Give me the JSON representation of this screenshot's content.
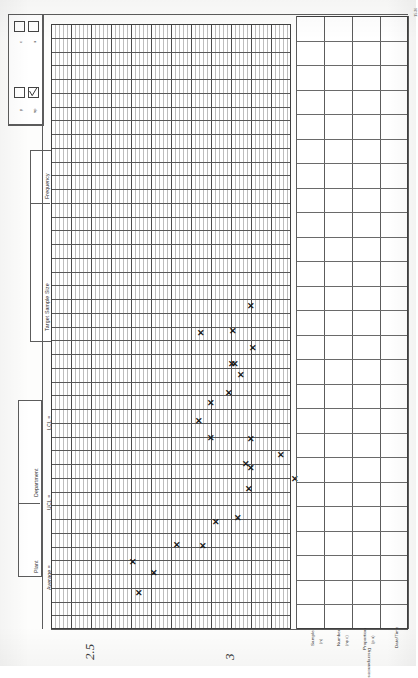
{
  "document": {
    "title": "Attributes Control Chart (p / np / c / u)",
    "form_code": "15-36",
    "orientation": "rotated-90"
  },
  "chart_type_checkboxes": [
    {
      "label": "c",
      "checked": false,
      "name": "checkbox-c"
    },
    {
      "label": "u",
      "checked": false,
      "name": "checkbox-u"
    },
    {
      "label": "p",
      "checked": false,
      "name": "checkbox-p"
    },
    {
      "label": "np",
      "checked": true,
      "name": "checkbox-np"
    }
  ],
  "header_fields": [
    {
      "label": "Frequency",
      "value": ""
    },
    {
      "label": "Target Sample Size",
      "value": ""
    },
    {
      "label": "Plant",
      "value": ""
    },
    {
      "label": "Department",
      "value": ""
    }
  ],
  "limit_fields": [
    {
      "label": "LCL =",
      "value": ""
    },
    {
      "label": "UCL =",
      "value": ""
    },
    {
      "label": "Average =",
      "value": ""
    }
  ],
  "table": {
    "row_group_label": "Discrepancies",
    "row_headers": [
      {
        "label": "Sample",
        "sub": "(n)"
      },
      {
        "label": "Number",
        "sub": "(np c)"
      },
      {
        "label": "Proportion",
        "sub": "(p u)"
      },
      {
        "label": "Date/Time",
        "sub": ""
      }
    ],
    "column_count": 25,
    "values": []
  },
  "axis_annotations": [
    {
      "text": "2.5",
      "handwritten": true
    },
    {
      "text": "3",
      "handwritten": true
    }
  ],
  "chart_data": {
    "type": "scatter",
    "xlabel": "Sample",
    "ylabel": "Number / Proportion",
    "marker": "x",
    "grid": true,
    "legend": "none",
    "xlim": [
      0,
      25
    ],
    "ylim": [
      0,
      60
    ],
    "x": [
      1,
      2,
      3,
      4,
      5,
      6,
      7,
      8,
      9,
      10,
      11,
      12,
      13,
      14,
      15,
      16,
      17,
      18,
      19,
      20,
      21,
      22,
      23,
      24
    ],
    "values": [
      3.0,
      2.0,
      3.5,
      4.0,
      5.5,
      5.0,
      7.0,
      9.5,
      11.5,
      12.0,
      13.0,
      16.5,
      17.0,
      18.5,
      20.0,
      22.5,
      24.5,
      27.0,
      30.0,
      32.0,
      34.5,
      37.0,
      40.5,
      43.0
    ],
    "points": [
      {
        "px": 138,
        "py": 593
      },
      {
        "px": 132,
        "py": 562
      },
      {
        "px": 153,
        "py": 573
      },
      {
        "px": 176,
        "py": 545
      },
      {
        "px": 202,
        "py": 546
      },
      {
        "px": 215,
        "py": 522
      },
      {
        "px": 237,
        "py": 518
      },
      {
        "px": 248,
        "py": 489
      },
      {
        "px": 294,
        "py": 479
      },
      {
        "px": 250,
        "py": 468
      },
      {
        "px": 250,
        "py": 439
      },
      {
        "px": 245,
        "py": 464
      },
      {
        "px": 280,
        "py": 455
      },
      {
        "px": 210,
        "py": 438
      },
      {
        "px": 198,
        "py": 421
      },
      {
        "px": 210,
        "py": 403
      },
      {
        "px": 228,
        "py": 393
      },
      {
        "px": 231,
        "py": 364
      },
      {
        "px": 240,
        "py": 375
      },
      {
        "px": 234,
        "py": 364
      },
      {
        "px": 252,
        "py": 348
      },
      {
        "px": 232,
        "py": 331
      },
      {
        "px": 200,
        "py": 333
      },
      {
        "px": 250,
        "py": 306
      }
    ]
  }
}
